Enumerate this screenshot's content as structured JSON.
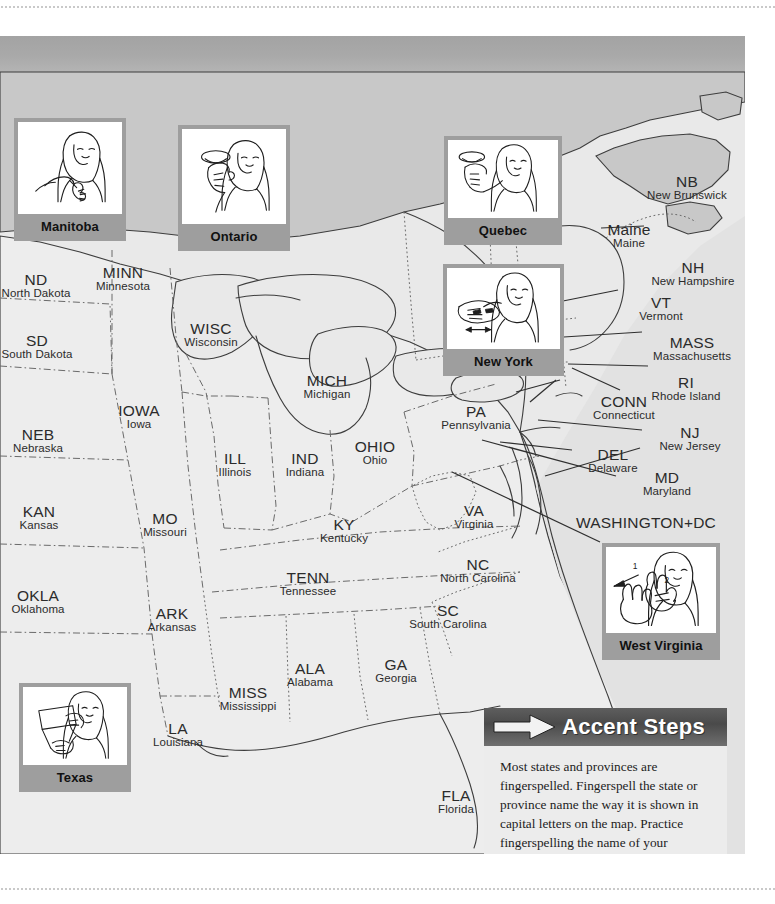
{
  "page": {
    "background_color": "#ffffff",
    "plate_color": "#e9e9e9",
    "header_band_color": "#a9a9a9",
    "canada_fill": "#c8c8c8",
    "card_frame_color": "#9e9e9e"
  },
  "labels": [
    {
      "abbr": "ND",
      "full": "North Dakota",
      "x": 36,
      "y": 236,
      "align": "center"
    },
    {
      "abbr": "MINN",
      "full": "Minnesota",
      "x": 123,
      "y": 229,
      "align": "center"
    },
    {
      "abbr": "SD",
      "full": "South Dakota",
      "x": 37,
      "y": 297,
      "align": "center"
    },
    {
      "abbr": "WISC",
      "full": "Wisconsin",
      "x": 211,
      "y": 285,
      "align": "center"
    },
    {
      "abbr": "MICH",
      "full": "Michigan",
      "x": 327,
      "y": 337,
      "align": "center"
    },
    {
      "abbr": "NEB",
      "full": "Nebraska",
      "x": 38,
      "y": 391,
      "align": "center"
    },
    {
      "abbr": "IOWA",
      "full": "Iowa",
      "x": 139,
      "y": 367,
      "align": "center"
    },
    {
      "abbr": "ILL",
      "full": "Illinois",
      "x": 235,
      "y": 415,
      "align": "center"
    },
    {
      "abbr": "IND",
      "full": "Indiana",
      "x": 305,
      "y": 415,
      "align": "center"
    },
    {
      "abbr": "OHIO",
      "full": "Ohio",
      "x": 375,
      "y": 403,
      "align": "center"
    },
    {
      "abbr": "PA",
      "full": "Pennsylvania",
      "x": 476,
      "y": 368,
      "align": "center"
    },
    {
      "abbr": "KAN",
      "full": "Kansas",
      "x": 39,
      "y": 468,
      "align": "center"
    },
    {
      "abbr": "MO",
      "full": "Missouri",
      "x": 165,
      "y": 475,
      "align": "center"
    },
    {
      "abbr": "KY",
      "full": "Kentucky",
      "x": 344,
      "y": 481,
      "align": "center"
    },
    {
      "abbr": "VA",
      "full": "Virginia",
      "x": 474,
      "y": 467,
      "align": "center"
    },
    {
      "abbr": "OKLA",
      "full": "Oklahoma",
      "x": 38,
      "y": 552,
      "align": "center"
    },
    {
      "abbr": "ARK",
      "full": "Arkansas",
      "x": 172,
      "y": 570,
      "align": "center"
    },
    {
      "abbr": "TENN",
      "full": "Tennessee",
      "x": 308,
      "y": 534,
      "align": "center"
    },
    {
      "abbr": "NC",
      "full": "North Carolina",
      "x": 478,
      "y": 521,
      "align": "center"
    },
    {
      "abbr": "SC",
      "full": "South Carolina",
      "x": 448,
      "y": 567,
      "align": "center"
    },
    {
      "abbr": "MISS",
      "full": "Mississippi",
      "x": 248,
      "y": 649,
      "align": "center"
    },
    {
      "abbr": "ALA",
      "full": "Alabama",
      "x": 310,
      "y": 625,
      "align": "center"
    },
    {
      "abbr": "GA",
      "full": "Georgia",
      "x": 396,
      "y": 621,
      "align": "center"
    },
    {
      "abbr": "LA",
      "full": "Louisiana",
      "x": 178,
      "y": 685,
      "align": "center"
    },
    {
      "abbr": "FLA",
      "full": "Florida",
      "x": 456,
      "y": 752,
      "align": "center"
    },
    {
      "abbr": "NB",
      "full": "New Brunswick",
      "x": 687,
      "y": 138,
      "align": "center"
    },
    {
      "abbr": "Maine",
      "full": "Maine",
      "x": 629,
      "y": 186,
      "align": "center"
    },
    {
      "abbr": "NH",
      "full": "New Hampshire",
      "x": 693,
      "y": 224,
      "align": "center"
    },
    {
      "abbr": "VT",
      "full": "Vermont",
      "x": 661,
      "y": 259,
      "align": "center"
    },
    {
      "abbr": "MASS",
      "full": "Massachusetts",
      "x": 692,
      "y": 299,
      "align": "center"
    },
    {
      "abbr": "RI",
      "full": "Rhode Island",
      "x": 686,
      "y": 339,
      "align": "center"
    },
    {
      "abbr": "CONN",
      "full": "Connecticut",
      "x": 624,
      "y": 358,
      "align": "center"
    },
    {
      "abbr": "NJ",
      "full": "New Jersey",
      "x": 690,
      "y": 389,
      "align": "center"
    },
    {
      "abbr": "DEL",
      "full": "Delaware",
      "x": 613,
      "y": 411,
      "align": "center"
    },
    {
      "abbr": "MD",
      "full": "Maryland",
      "x": 667,
      "y": 434,
      "align": "center"
    },
    {
      "abbr": "WASHINGTON+DC",
      "full": "",
      "x": 646,
      "y": 479,
      "align": "center"
    }
  ],
  "cards": [
    {
      "name": "Manitoba",
      "x": 14,
      "y": 82,
      "w": 104,
      "h": 121,
      "pic_h": 92,
      "sign": "manitoba"
    },
    {
      "name": "Ontario",
      "x": 178,
      "y": 89,
      "w": 104,
      "h": 124,
      "pic_h": 95,
      "sign": "ontario"
    },
    {
      "name": "Quebec",
      "x": 444,
      "y": 100,
      "w": 110,
      "h": 108,
      "pic_h": 78,
      "sign": "quebec"
    },
    {
      "name": "New York",
      "x": 443,
      "y": 228,
      "w": 113,
      "h": 111,
      "pic_h": 81,
      "sign": "newyork"
    },
    {
      "name": "West Virginia",
      "x": 602,
      "y": 507,
      "w": 110,
      "h": 116,
      "pic_h": 86,
      "sign": "westvirginia"
    },
    {
      "name": "Texas",
      "x": 19,
      "y": 647,
      "w": 104,
      "h": 105,
      "pic_h": 78,
      "sign": "texas"
    }
  ],
  "accent_box": {
    "title": "Accent Steps",
    "icon": "arrow-right-icon",
    "body": "Most states and provinces are fingerspelled. Fingerspell the state or province name the way it is shown in capital letters on the map. Practice fingerspelling the name of your state/province quickly!"
  }
}
